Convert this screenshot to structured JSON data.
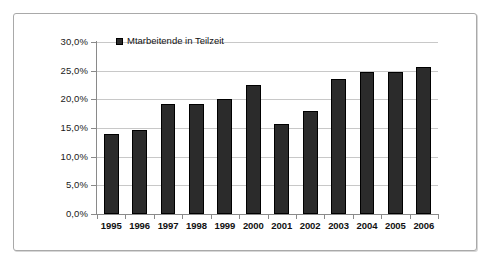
{
  "document": {
    "background_color": "#ffffff",
    "frame_border_color": "#a9a9a9"
  },
  "chart_data": {
    "type": "bar",
    "title": "",
    "subtitle": "",
    "xlabel": "",
    "ylabel": "",
    "categories": [
      "1995",
      "1996",
      "1997",
      "1998",
      "1999",
      "2000",
      "2001",
      "2002",
      "2003",
      "2004",
      "2005",
      "2006"
    ],
    "values": [
      14.0,
      14.7,
      19.2,
      19.2,
      20.0,
      22.5,
      15.7,
      18.0,
      23.5,
      24.8,
      24.8,
      25.6
    ],
    "value_labels": [
      "14,0%",
      "14,7%",
      "19,2%",
      "19,2%",
      "20,0%",
      "22,5%",
      "15,7%",
      "18,0%",
      "23,5%",
      "24,8%",
      "24,8%",
      "25,6%"
    ],
    "series": [
      {
        "name": "Mtarbeitende in Teilzeit",
        "color": "#2b2b2b",
        "values": [
          14.0,
          14.7,
          19.2,
          19.2,
          20.0,
          22.5,
          15.7,
          18.0,
          23.5,
          24.8,
          24.8,
          25.6
        ]
      }
    ],
    "ylim": [
      0,
      30
    ],
    "ytick_values": [
      0,
      5,
      10,
      15,
      20,
      25,
      30
    ],
    "ytick_labels": [
      "0,0%",
      "5,0%",
      "10,0%",
      "15,0%",
      "20,0%",
      "25,0%",
      "30,0%"
    ],
    "grid": true,
    "grid_axis": "y",
    "grid_color": "#c8c8c8",
    "legend": {
      "position": "top-left-inside",
      "entries": [
        {
          "label": "Mtarbeitende in Teilzeit",
          "color": "#2b2b2b"
        }
      ]
    },
    "axis_color": "#8a8a8a",
    "bar_color": "#2b2b2b",
    "bar_border_color": "#000000",
    "plot_background": "#ffffff"
  }
}
